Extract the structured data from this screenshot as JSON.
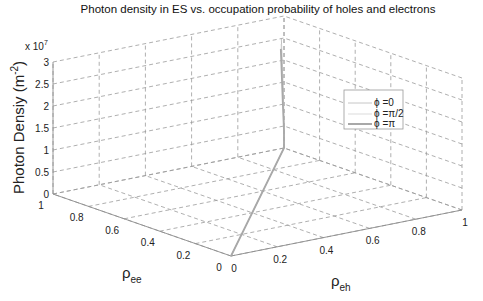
{
  "chart_data": {
    "type": "line3d",
    "title": "Photon density in ES vs. occupation probability of holes and electrons",
    "xlabel": "ρ_eh",
    "ylabel": "ρ_ee",
    "zlabel": "Photon Densiy (m^-2)",
    "xlabel_main": "ρ",
    "xlabel_sub": "eh",
    "ylabel_main": "ρ",
    "ylabel_sub": "ee",
    "zlabel_main": "Photon Densiy (m",
    "zlabel_sup": "-2",
    "zlabel_close": ")",
    "z_multiplier": "x 10",
    "z_multiplier_exp": "7",
    "xlim": [
      0,
      1
    ],
    "ylim": [
      0,
      1
    ],
    "zlim": [
      0,
      30000000
    ],
    "x_ticks": [
      "0",
      "0.2",
      "0.4",
      "0.6",
      "0.8",
      "1"
    ],
    "y_ticks": [
      "0",
      "0.2",
      "0.4",
      "0.6",
      "0.8",
      "1"
    ],
    "z_ticks": [
      "0",
      "0.5",
      "1",
      "1.5",
      "2",
      "2.5",
      "3"
    ],
    "grid": true,
    "legend_position": "right-middle",
    "series": [
      {
        "name": "ϕ =0",
        "color": "#b0b0b0",
        "width": 0.8,
        "points": [
          [
            0,
            0,
            0
          ],
          [
            0.5,
            0.5,
            0
          ],
          [
            1,
            1,
            0
          ],
          [
            1,
            1,
            0.5
          ],
          [
            0.99,
            0.99,
            1.2
          ],
          [
            0.97,
            0.97,
            1.9
          ],
          [
            0.95,
            0.95,
            2.6
          ]
        ]
      },
      {
        "name": "ϕ =π/2",
        "color": "#cfcfcf",
        "width": 0.8,
        "points": [
          [
            0,
            0,
            0
          ],
          [
            0.5,
            0.5,
            0
          ],
          [
            1,
            1,
            0
          ],
          [
            1,
            1,
            0.45
          ],
          [
            0.985,
            0.985,
            1.1
          ],
          [
            0.965,
            0.965,
            1.8
          ],
          [
            0.945,
            0.945,
            2.5
          ]
        ]
      },
      {
        "name": "ϕ =π",
        "color": "#a8a8a8",
        "width": 1.8,
        "points": [
          [
            0,
            0,
            0
          ],
          [
            0.5,
            0.5,
            0
          ],
          [
            1,
            1,
            0
          ],
          [
            1,
            1,
            0.4
          ],
          [
            0.98,
            0.98,
            1.0
          ],
          [
            0.96,
            0.96,
            1.7
          ],
          [
            0.94,
            0.94,
            2.4
          ]
        ]
      }
    ]
  },
  "legend": {
    "items": [
      {
        "symbol": "ϕ",
        "label": " =0"
      },
      {
        "symbol": "ϕ",
        "label": " =π/2"
      },
      {
        "symbol": "ϕ",
        "label": " =π"
      }
    ]
  }
}
